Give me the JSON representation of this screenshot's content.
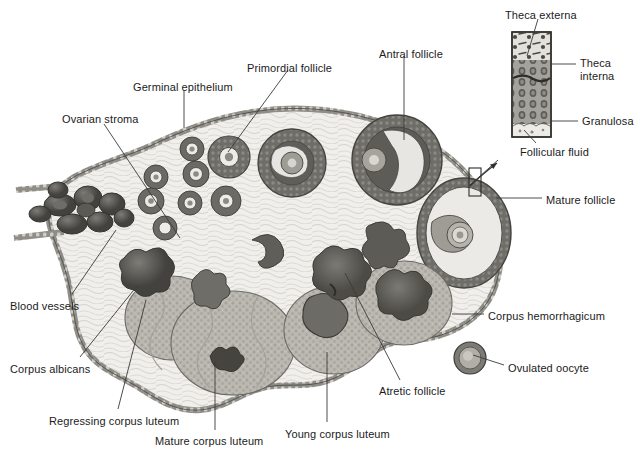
{
  "figure": {
    "background_color": "#ffffff",
    "text_color": "#1b1b1b",
    "line_color": "#3a3a3a",
    "width": 638,
    "height": 455
  },
  "palette": {
    "stroma_light": "#efeeea",
    "stroma_mid": "#dcdad4",
    "tunica": "#8e8d87",
    "follicle_dark": "#6f6e69",
    "follicle_rim": "#575652",
    "antrum": "#e9e8e4",
    "luteum_fill": "#b9b7b0",
    "luteum_speck": "#8d8b84",
    "vessel_dark": "#4f4e4a",
    "hemorrhage": "#5d5c57",
    "inset_fill": "#9a9993",
    "inset_top": "#ded</br>dd8"
  },
  "labels": [
    {
      "id": "ovarian-stroma",
      "text": "Ovarian stroma",
      "x": 62,
      "y": 113,
      "align": "left"
    },
    {
      "id": "germinal-epithelium",
      "text": "Germinal epithelium",
      "x": 133,
      "y": 81,
      "align": "left"
    },
    {
      "id": "primordial-follicle",
      "text": "Primordial follicle",
      "x": 247,
      "y": 62,
      "align": "left"
    },
    {
      "id": "antral-follicle",
      "text": "Antral follicle",
      "x": 379,
      "y": 48,
      "align": "left"
    },
    {
      "id": "theca-externa",
      "text": "Theca externa",
      "x": 505,
      "y": 9,
      "align": "left"
    },
    {
      "id": "theca-interna",
      "text": "Theca\ninterna",
      "x": 580,
      "y": 57,
      "align": "left"
    },
    {
      "id": "granulosa",
      "text": "Granulosa",
      "x": 582,
      "y": 115,
      "align": "left"
    },
    {
      "id": "follicular-fluid",
      "text": "Follicular fluid",
      "x": 520,
      "y": 146,
      "align": "left"
    },
    {
      "id": "mature-follicle",
      "text": "Mature follicle",
      "x": 546,
      "y": 194,
      "align": "left"
    },
    {
      "id": "corpus-hemorrhagicum",
      "text": "Corpus hemorrhagicum",
      "x": 488,
      "y": 310,
      "align": "left"
    },
    {
      "id": "ovulated-oocyte",
      "text": "Ovulated oocyte",
      "x": 508,
      "y": 362,
      "align": "left"
    },
    {
      "id": "blood-vessels",
      "text": "Blood vessels",
      "x": 10,
      "y": 300,
      "align": "left"
    },
    {
      "id": "corpus-albicans",
      "text": "Corpus albicans",
      "x": 10,
      "y": 363,
      "align": "left"
    },
    {
      "id": "regressing-corpus-luteum",
      "text": "Regressing corpus luteum",
      "x": 49,
      "y": 415,
      "align": "left"
    },
    {
      "id": "mature-corpus-luteum",
      "text": "Mature corpus luteum",
      "x": 155,
      "y": 435,
      "align": "left"
    },
    {
      "id": "young-corpus-luteum",
      "text": "Young corpus luteum",
      "x": 285,
      "y": 428,
      "align": "left"
    },
    {
      "id": "atretic-follicle",
      "text": "Atretic follicle",
      "x": 379,
      "y": 385,
      "align": "left"
    }
  ],
  "leaders": [
    {
      "id": "leader-ovarian-stroma",
      "points": "104,124 180,238"
    },
    {
      "id": "leader-germinal-epithelium",
      "points": "184,90 184,128"
    },
    {
      "id": "leader-primordial-follicle",
      "points": "288,70 228,152"
    },
    {
      "id": "leader-antral-follicle",
      "points": "404,56 404,140"
    },
    {
      "id": "leader-theca-externa",
      "points": "538,19 527,56"
    },
    {
      "id": "leader-theca-interna",
      "points": "576,64 551,64"
    },
    {
      "id": "leader-granulosa",
      "points": "578,121 551,121"
    },
    {
      "id": "leader-follicular-fluid",
      "points": "536,143 524,130"
    },
    {
      "id": "leader-mature-follicle",
      "points": "542,198 496,198"
    },
    {
      "id": "leader-corpus-hemorrhagicum",
      "points": "484,314 452,314"
    },
    {
      "id": "leader-ovulated-oocyte",
      "points": "504,365 473,355"
    },
    {
      "id": "leader-blood-vessels",
      "points": "72,294 116,230"
    },
    {
      "id": "leader-corpus-albicans",
      "points": "80,357 137,286"
    },
    {
      "id": "leader-regressing-corpus-luteum",
      "points": "118,409 146,300"
    },
    {
      "id": "leader-mature-corpus-luteum",
      "points": "215,430 215,362"
    },
    {
      "id": "leader-young-corpus-luteum",
      "points": "327,422 327,352"
    },
    {
      "id": "leader-atretic-follicle",
      "points": "400,380 345,273"
    },
    {
      "id": "leader-inset-arrow",
      "points": "470,185 498,160"
    }
  ],
  "inset": {
    "id": "follicle-wall-inset",
    "x": 512,
    "y": 32,
    "width": 39,
    "height": 105,
    "callout_box": {
      "x": 469,
      "y": 168,
      "width": 12,
      "height": 28
    }
  }
}
